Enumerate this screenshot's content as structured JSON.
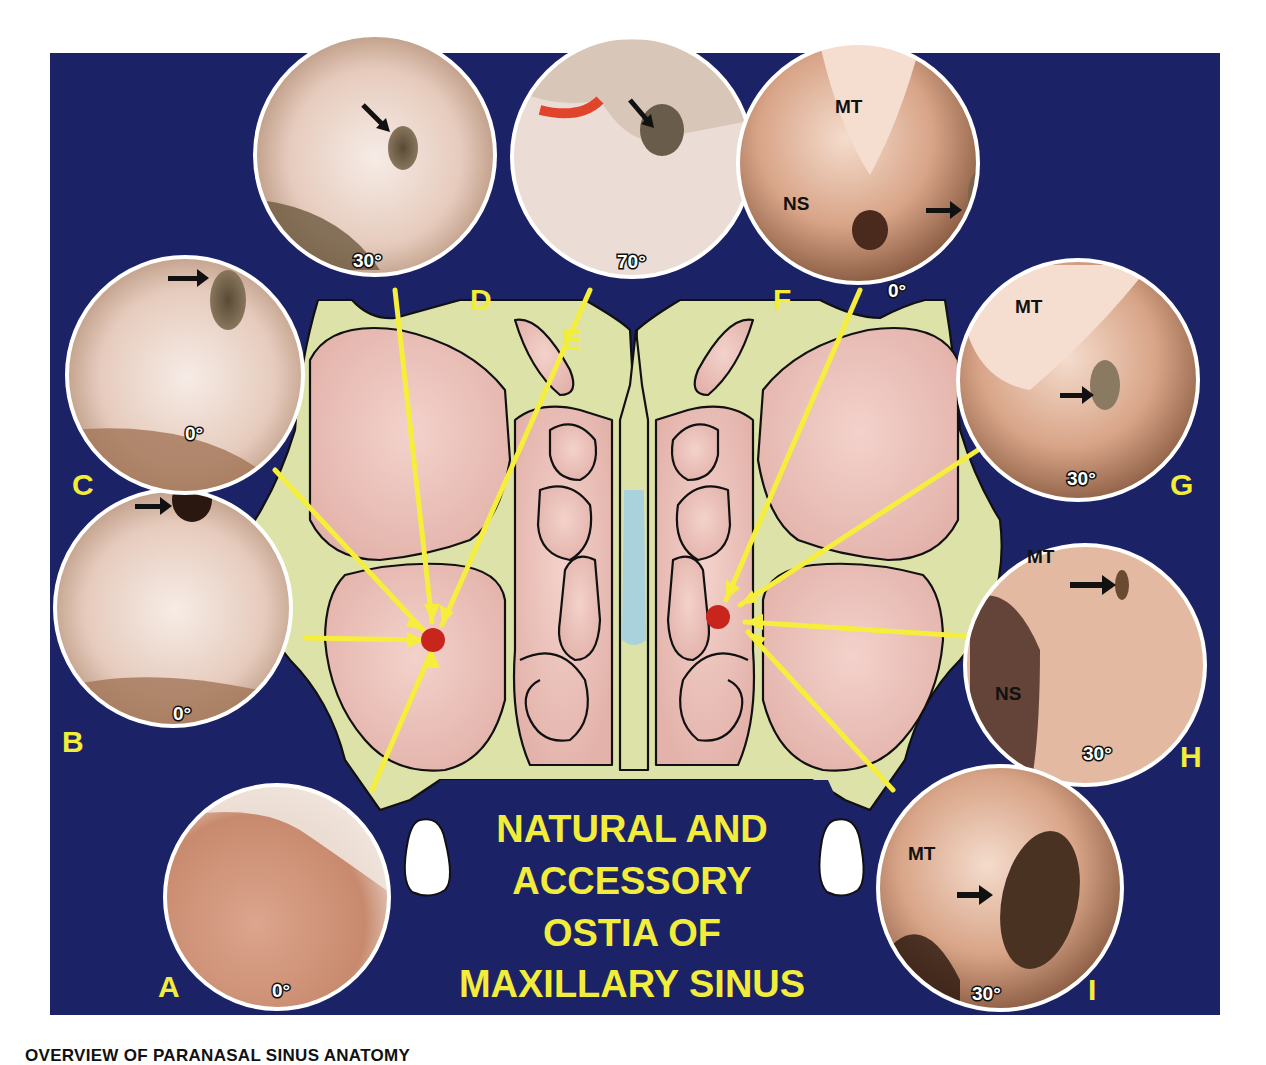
{
  "figure": {
    "title_lines": [
      "NATURAL AND",
      "ACCESSORY",
      "OSTIA OF",
      "MAXILLARY SINUS"
    ],
    "caption": "OVERVIEW OF PARANASAL SINUS ANATOMY",
    "colors": {
      "background": "#1c2266",
      "bone": "#dde3a8",
      "sinus": "#ecc4bd",
      "septum_cartilage": "#a9d2dd",
      "ostium_marker": "#c8261c",
      "pointer_lines": "#f6ee3c",
      "label_text": "#f2ec3a",
      "frame": "#ffffff"
    }
  },
  "panels": [
    {
      "id": "A",
      "letter": "A",
      "angle": "0°",
      "structures": [],
      "has_arrow": false
    },
    {
      "id": "B",
      "letter": "B",
      "angle": "0°",
      "structures": [],
      "has_arrow": true
    },
    {
      "id": "C",
      "letter": "C",
      "angle": "0°",
      "structures": [],
      "has_arrow": true
    },
    {
      "id": "D",
      "letter": "D",
      "angle": "30°",
      "structures": [],
      "has_arrow": true
    },
    {
      "id": "E",
      "letter": "E",
      "angle": "70°",
      "structures": [],
      "has_arrow": true
    },
    {
      "id": "F",
      "letter": "F",
      "angle": "0°",
      "structures": [
        "MT",
        "NS"
      ],
      "has_arrow": true
    },
    {
      "id": "G",
      "letter": "G",
      "angle": "30°",
      "structures": [
        "MT"
      ],
      "has_arrow": true
    },
    {
      "id": "H",
      "letter": "H",
      "angle": "30°",
      "structures": [
        "MT",
        "NS"
      ],
      "has_arrow": true
    },
    {
      "id": "I",
      "letter": "I",
      "angle": "30°",
      "structures": [
        "MT"
      ],
      "has_arrow": true
    }
  ],
  "markers": [
    {
      "side": "left",
      "points_from": [
        "A",
        "B",
        "C",
        "D",
        "E"
      ]
    },
    {
      "side": "right",
      "points_from": [
        "F",
        "G",
        "H",
        "I"
      ]
    }
  ]
}
